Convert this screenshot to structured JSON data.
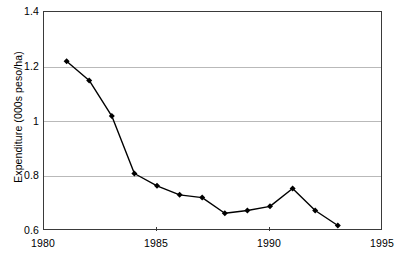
{
  "chart_data": {
    "type": "line",
    "title": "",
    "subtitle": "",
    "xlabel": "",
    "ylabel": "Expenditure (000s peso/ha)",
    "xlim": [
      1980,
      1995
    ],
    "ylim": [
      0.6,
      1.4
    ],
    "grid": "horizontal",
    "legend": "none",
    "marker": "diamond",
    "line_color": "#000000",
    "marker_color": "#000000",
    "grid_color": "#b9b9b9",
    "axis_color": "#3a3a3a",
    "background_color": "#ffffff",
    "x": [
      1981,
      1982,
      1983,
      1984,
      1985,
      1986,
      1987,
      1988,
      1989,
      1990,
      1991,
      1992,
      1993
    ],
    "values": [
      1.22,
      1.15,
      1.02,
      0.81,
      0.765,
      0.732,
      0.722,
      0.665,
      0.675,
      0.69,
      0.755,
      0.675,
      0.62
    ],
    "series": [
      {
        "name": "Expenditure",
        "x": [
          1981,
          1982,
          1983,
          1984,
          1985,
          1986,
          1987,
          1988,
          1989,
          1990,
          1991,
          1992,
          1993
        ],
        "values": [
          1.22,
          1.15,
          1.02,
          0.81,
          0.765,
          0.732,
          0.722,
          0.665,
          0.675,
          0.69,
          0.755,
          0.675,
          0.62
        ]
      }
    ],
    "x_ticks": [
      1980,
      1985,
      1990,
      1995
    ],
    "x_tick_labels": [
      "1980",
      "1985",
      "1990",
      "1995"
    ],
    "y_ticks": [
      0.6,
      0.8,
      1.0,
      1.2,
      1.4
    ],
    "y_tick_labels": [
      "0.6",
      "0.8",
      "1",
      "1.2",
      "1.4"
    ]
  }
}
